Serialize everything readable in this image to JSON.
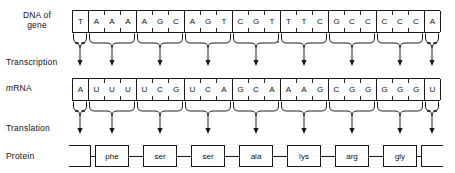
{
  "figure": {
    "labels": {
      "dna": "DNA of\ngene",
      "transcription": "Transcription",
      "mrna_prefix": "m",
      "mrna_suffix": "RNA",
      "translation": "Translation",
      "protein": "Protein"
    },
    "colors": {
      "ink": "#111111",
      "rule": "#1a1a1a",
      "background": "#ffffff"
    }
  },
  "dna": {
    "sequence": "TAAAAGCAGTCGTTTCGCCCCCA",
    "bases": [
      "T",
      "A",
      "A",
      "A",
      "A",
      "G",
      "C",
      "A",
      "G",
      "T",
      "C",
      "G",
      "T",
      "T",
      "T",
      "C",
      "G",
      "C",
      "C",
      "C",
      "C",
      "C",
      "A"
    ],
    "groups": [
      {
        "bases": [
          "T"
        ],
        "partial": true
      },
      {
        "bases": [
          "A",
          "A",
          "A"
        ],
        "partial": false
      },
      {
        "bases": [
          "A",
          "G",
          "C"
        ],
        "partial": false
      },
      {
        "bases": [
          "A",
          "G",
          "T"
        ],
        "partial": false
      },
      {
        "bases": [
          "C",
          "G",
          "T"
        ],
        "partial": false
      },
      {
        "bases": [
          "T",
          "T",
          "C"
        ],
        "partial": false
      },
      {
        "bases": [
          "G",
          "C",
          "C"
        ],
        "partial": false
      },
      {
        "bases": [
          "C",
          "C",
          "C"
        ],
        "partial": false
      },
      {
        "bases": [
          "A"
        ],
        "partial": true
      }
    ]
  },
  "mrna": {
    "sequence": "AUUUUCGUCAGCAAAGCGGGGGU",
    "bases": [
      "A",
      "U",
      "U",
      "U",
      "U",
      "C",
      "G",
      "U",
      "C",
      "A",
      "G",
      "C",
      "A",
      "A",
      "A",
      "G",
      "C",
      "G",
      "G",
      "G",
      "G",
      "G",
      "U"
    ],
    "codons": [
      {
        "bases": [
          "A"
        ],
        "partial": true
      },
      {
        "bases": [
          "U",
          "U",
          "U"
        ],
        "partial": false
      },
      {
        "bases": [
          "U",
          "C",
          "G"
        ],
        "partial": false
      },
      {
        "bases": [
          "U",
          "C",
          "A"
        ],
        "partial": false
      },
      {
        "bases": [
          "G",
          "C",
          "A"
        ],
        "partial": false
      },
      {
        "bases": [
          "A",
          "A",
          "G"
        ],
        "partial": false
      },
      {
        "bases": [
          "C",
          "G",
          "G"
        ],
        "partial": false
      },
      {
        "bases": [
          "G",
          "G",
          "G"
        ],
        "partial": false
      },
      {
        "bases": [
          "U"
        ],
        "partial": true
      }
    ]
  },
  "protein": {
    "residues": [
      {
        "label": "",
        "terminal": "left"
      },
      {
        "label": "phe",
        "terminal": ""
      },
      {
        "label": "ser",
        "terminal": ""
      },
      {
        "label": "ser",
        "terminal": ""
      },
      {
        "label": "ala",
        "terminal": ""
      },
      {
        "label": "lys",
        "terminal": ""
      },
      {
        "label": "arg",
        "terminal": ""
      },
      {
        "label": "gly",
        "terminal": ""
      },
      {
        "label": "",
        "terminal": "right"
      }
    ]
  },
  "chart_data": {
    "type": "diagram",
    "rows": [
      "DNA of gene",
      "Transcription",
      "mRNA",
      "Translation",
      "Protein"
    ],
    "dna_triplets": [
      "T",
      "AAA",
      "AGC",
      "AGT",
      "CGT",
      "TTC",
      "GCC",
      "CCC",
      "A"
    ],
    "mrna_codons": [
      "A",
      "UUU",
      "UCG",
      "UCA",
      "GCA",
      "AAG",
      "CGG",
      "GGG",
      "U"
    ],
    "amino_acids": [
      "phe",
      "ser",
      "ser",
      "ala",
      "lys",
      "arg",
      "gly"
    ],
    "codon_to_amino_acid": [
      {
        "codon": "UUU",
        "amino_acid": "phe"
      },
      {
        "codon": "UCG",
        "amino_acid": "ser"
      },
      {
        "codon": "UCA",
        "amino_acid": "ser"
      },
      {
        "codon": "GCA",
        "amino_acid": "ala"
      },
      {
        "codon": "AAG",
        "amino_acid": "lys"
      },
      {
        "codon": "CGG",
        "amino_acid": "arg"
      },
      {
        "codon": "GGG",
        "amino_acid": "gly"
      }
    ]
  }
}
